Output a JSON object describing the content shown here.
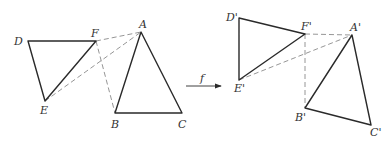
{
  "figure": {
    "colors": {
      "line": "#2a2a2a",
      "dashed": "#8a8a8a",
      "label": "#333333"
    },
    "arrow_label": "f",
    "original": {
      "labels": {
        "A": "A",
        "B": "B",
        "C": "C",
        "D": "D",
        "E": "E",
        "F": "F"
      },
      "points": {
        "A": [
          141,
          32
        ],
        "B": [
          115,
          113
        ],
        "C": [
          182,
          113
        ],
        "D": [
          28,
          41
        ],
        "E": [
          45,
          101
        ],
        "F": [
          96,
          41
        ]
      },
      "solid_segments": [
        [
          "D",
          "F"
        ],
        [
          "F",
          "E"
        ],
        [
          "E",
          "D"
        ],
        [
          "A",
          "B"
        ],
        [
          "B",
          "C"
        ],
        [
          "C",
          "A"
        ]
      ],
      "dashed_segments": [
        [
          "F",
          "A"
        ],
        [
          "E",
          "A"
        ],
        [
          "F",
          "B"
        ]
      ]
    },
    "image": {
      "labels": {
        "A": "A'",
        "B": "B'",
        "C": "C'",
        "D": "D'",
        "E": "E'",
        "F": "F'"
      },
      "points": {
        "A": [
          352,
          35
        ],
        "B": [
          305,
          108
        ],
        "C": [
          371,
          125
        ],
        "D": [
          239,
          18
        ],
        "E": [
          239,
          80
        ],
        "F": [
          305,
          34
        ]
      },
      "solid_segments": [
        [
          "D",
          "F"
        ],
        [
          "F",
          "E"
        ],
        [
          "E",
          "D"
        ],
        [
          "A",
          "B"
        ],
        [
          "B",
          "C"
        ],
        [
          "C",
          "A"
        ]
      ],
      "dashed_segments": [
        [
          "F",
          "A"
        ],
        [
          "E",
          "A"
        ],
        [
          "F",
          "B"
        ]
      ]
    }
  }
}
